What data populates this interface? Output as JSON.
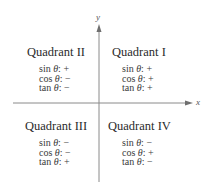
{
  "diagram": {
    "axes": {
      "x_label": "x",
      "y_label": "y",
      "color": "#8a8a8a"
    },
    "quadrants": [
      {
        "id": "II",
        "title": "Quadrant II",
        "signs": [
          {
            "fn": "sin",
            "sign": "+"
          },
          {
            "fn": "cos",
            "sign": "−"
          },
          {
            "fn": "tan",
            "sign": "−"
          }
        ]
      },
      {
        "id": "I",
        "title": "Quadrant I",
        "signs": [
          {
            "fn": "sin",
            "sign": "+"
          },
          {
            "fn": "cos",
            "sign": "+"
          },
          {
            "fn": "tan",
            "sign": "+"
          }
        ]
      },
      {
        "id": "III",
        "title": "Quadrant III",
        "signs": [
          {
            "fn": "sin",
            "sign": "−"
          },
          {
            "fn": "cos",
            "sign": "−"
          },
          {
            "fn": "tan",
            "sign": "+"
          }
        ]
      },
      {
        "id": "IV",
        "title": "Quadrant IV",
        "signs": [
          {
            "fn": "sin",
            "sign": "−"
          },
          {
            "fn": "cos",
            "sign": "+"
          },
          {
            "fn": "tan",
            "sign": "−"
          }
        ]
      }
    ],
    "theta": "θ"
  }
}
